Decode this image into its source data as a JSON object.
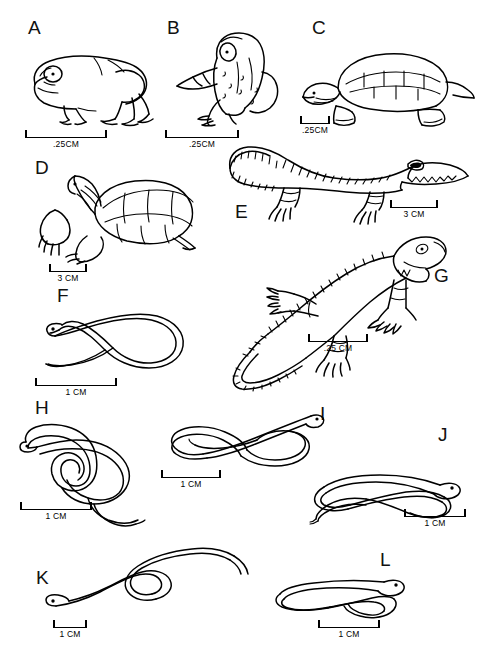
{
  "figure": {
    "type": "scientific-plate",
    "background_color": "#ffffff",
    "line_color": "#000000",
    "panel_count": 12
  },
  "panels": [
    {
      "id": "A",
      "letter": "A",
      "subject": "frog",
      "subject_icon": "frog-lateral-icon",
      "scale_label": ".25CM",
      "scale_value": 0.25,
      "scale_unit": "CM"
    },
    {
      "id": "B",
      "letter": "B",
      "subject": "toad",
      "subject_icon": "toad-dorsolateral-icon",
      "scale_label": ".25CM",
      "scale_value": 0.25,
      "scale_unit": "CM"
    },
    {
      "id": "C",
      "letter": "C",
      "subject": "softshell turtle",
      "subject_icon": "turtle-lateral-icon",
      "scale_label": ".25CM",
      "scale_value": 0.25,
      "scale_unit": "CM"
    },
    {
      "id": "D",
      "letter": "D",
      "subject": "tortoise",
      "subject_icon": "tortoise-lateral-icon",
      "scale_label": "3 CM",
      "scale_value": 3,
      "scale_unit": "CM"
    },
    {
      "id": "E",
      "letter": "E",
      "subject": "crocodilian",
      "subject_icon": "crocodile-lateral-icon",
      "scale_label": "3 CM",
      "scale_value": 3,
      "scale_unit": "CM"
    },
    {
      "id": "F",
      "letter": "F",
      "subject": "snake",
      "subject_icon": "snake-looped-icon",
      "scale_label": "1 CM",
      "scale_value": 1,
      "scale_unit": "CM"
    },
    {
      "id": "G",
      "letter": "G",
      "subject": "lizard",
      "subject_icon": "lizard-dorsolateral-icon",
      "scale_label": ".25 CM",
      "scale_value": 0.25,
      "scale_unit": "CM"
    },
    {
      "id": "H",
      "letter": "H",
      "subject": "snake",
      "subject_icon": "snake-coiled-icon",
      "scale_label": "1 CM",
      "scale_value": 1,
      "scale_unit": "CM"
    },
    {
      "id": "I",
      "letter": "I",
      "subject": "snake",
      "subject_icon": "snake-crossed-loops-icon",
      "scale_label": "1 CM",
      "scale_value": 1,
      "scale_unit": "CM"
    },
    {
      "id": "J",
      "letter": "J",
      "subject": "snake",
      "subject_icon": "snake-knotted-icon",
      "scale_label": "1 CM",
      "scale_value": 1,
      "scale_unit": "CM"
    },
    {
      "id": "K",
      "letter": "K",
      "subject": "snake",
      "subject_icon": "snake-undulating-icon",
      "scale_label": "1 CM",
      "scale_value": 1,
      "scale_unit": "CM"
    },
    {
      "id": "L",
      "letter": "L",
      "subject": "snake",
      "subject_icon": "snake-flat-loop-icon",
      "scale_label": "1 CM",
      "scale_value": 1,
      "scale_unit": "CM"
    }
  ]
}
